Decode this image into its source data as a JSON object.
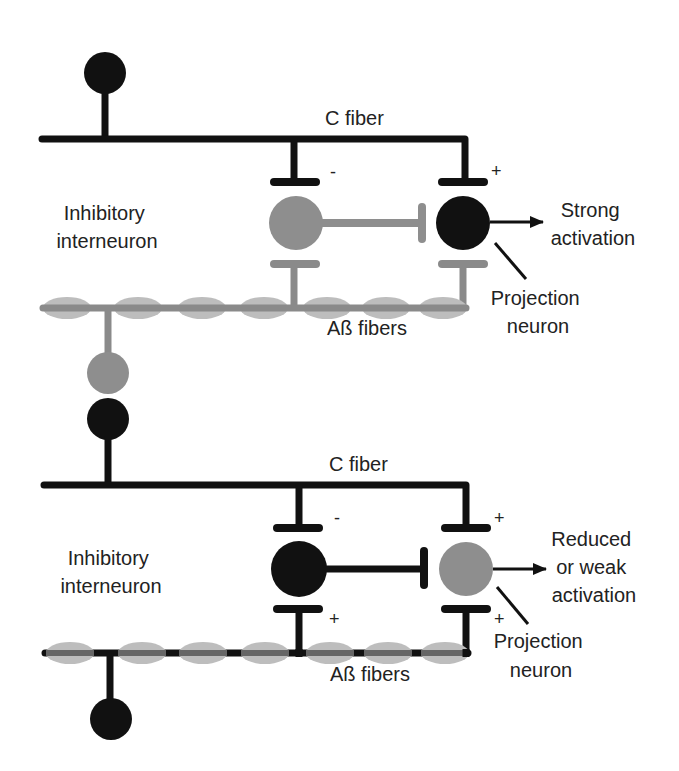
{
  "colors": {
    "black": "#111111",
    "gray_neuron": "#8e8e8e",
    "gray_fiber": "#8a8a8a",
    "light_bead": "#bdbdbd",
    "text": "#222222"
  },
  "panels": [
    {
      "id": "top",
      "c_fiber_label": "C fiber",
      "interneuron_label": [
        "Inhibitory",
        "interneuron"
      ],
      "interneuron_state": "inactive (gray)",
      "interneuron_input_sign": "-",
      "projection_input_sign": "+",
      "projection_state": "active (black)",
      "output_label": [
        "Strong",
        "activation"
      ],
      "projection_label": [
        "Projection",
        "neuron"
      ],
      "abeta_label": "Aß fibers",
      "abeta_state": "inactive (gray)"
    },
    {
      "id": "bottom",
      "c_fiber_label": "C fiber",
      "interneuron_label": [
        "Inhibitory",
        "interneuron"
      ],
      "interneuron_state": "active (black)",
      "interneuron_input_sign": "-",
      "interneuron_abeta_sign": "+",
      "projection_input_sign": "+",
      "projection_abeta_sign": "+",
      "projection_state": "inhibited (gray)",
      "output_label": [
        "Reduced",
        "or weak",
        "activation"
      ],
      "projection_label": [
        "Projection",
        "neuron"
      ],
      "abeta_label": "Aß fibers",
      "abeta_state": "active (black core)"
    }
  ]
}
